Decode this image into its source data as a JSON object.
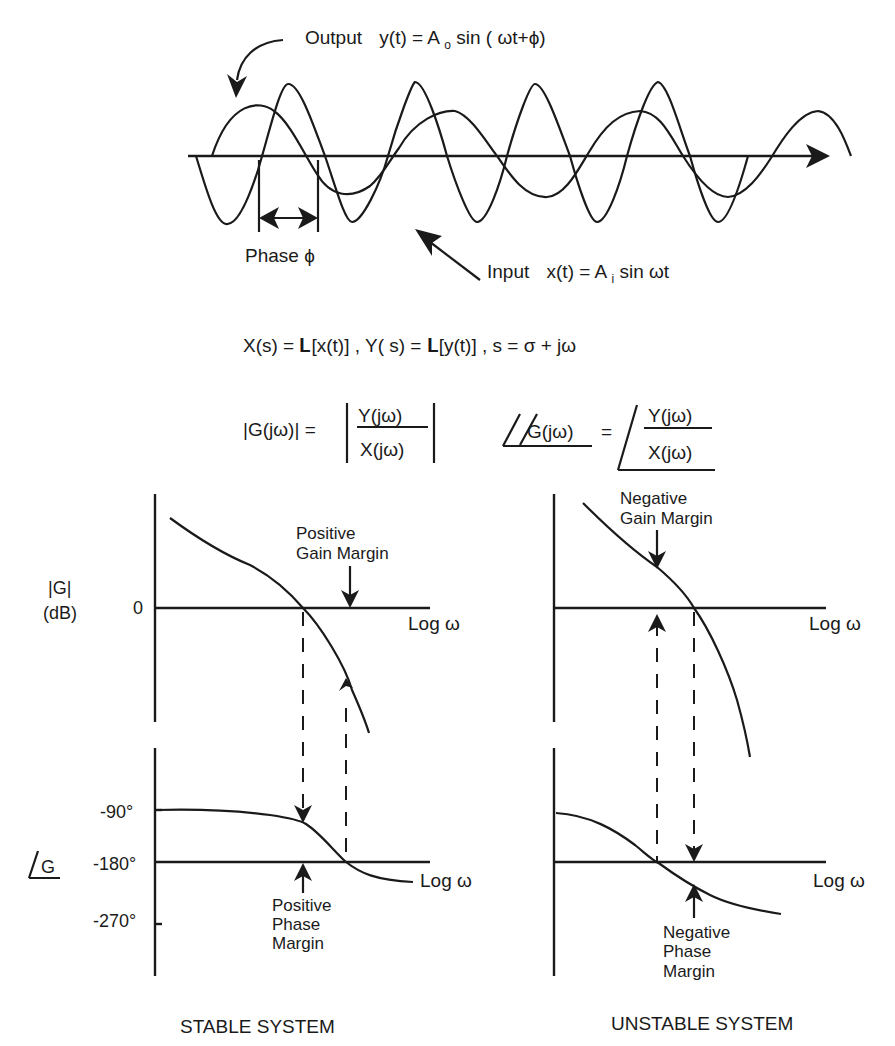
{
  "signals": {
    "output_label": "Output",
    "output_eq": "y(t) = A",
    "output_sub": "o",
    "output_eq_tail": "sin (  ωt+ϕ)",
    "input_label": "Input",
    "input_eq": "x(t) = A",
    "input_sub": "i",
    "input_eq_tail": "sin   ωt",
    "phase_label": "Phase ϕ"
  },
  "equations": {
    "laplace": "X(s) =  𝐋[x(t)] ,  Y( s) =  𝐋[y(t)] ,  s =  σ + jω",
    "magnitude_lhs": "|G(jω)| =",
    "numerator": "Y(jω)",
    "denominator": "X(jω)",
    "phase_lhs": "G(jω)",
    "phase_eq": "="
  },
  "stable": {
    "caption": "STABLE SYSTEM",
    "mag_axis_label_1": "|G|",
    "mag_axis_label_2": "(dB)",
    "mag_zero_tick": "0",
    "mag_x_label": "Log ω",
    "gain_margin_1": "Positive",
    "gain_margin_2": "Gain Margin",
    "phase_axis_label": "G",
    "phase_ticks": [
      "-90°",
      "-180°",
      "-270°"
    ],
    "phase_x_label": "Log ω",
    "phase_margin_1": "Positive",
    "phase_margin_2": "Phase",
    "phase_margin_3": "Margin"
  },
  "unstable": {
    "caption": "UNSTABLE SYSTEM",
    "mag_x_label": "Log ω",
    "gain_margin_1": "Negative",
    "gain_margin_2": "Gain Margin",
    "phase_x_label": "Log ω",
    "phase_margin_1": "Negative",
    "phase_margin_2": "Phase",
    "phase_margin_3": "Margin"
  }
}
